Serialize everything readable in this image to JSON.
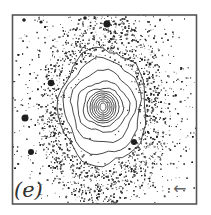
{
  "figure": {
    "panel_label": "(e)",
    "arrow_glyph": "←",
    "arrow_direction": "left",
    "content": "galaxy image with isophote contours over a dense speckled disk",
    "colors": {
      "background": "#ffffff",
      "frame": "#555555",
      "points": "#2a2a2a",
      "contours": "#333333"
    }
  }
}
